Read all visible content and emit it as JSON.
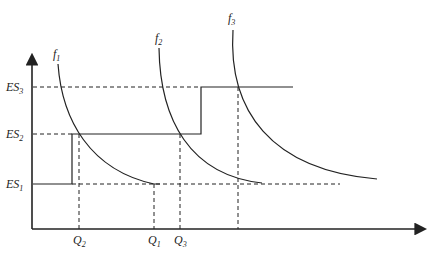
{
  "diagram": {
    "y_labels": [
      {
        "main": "ES",
        "sub": "3"
      },
      {
        "main": "ES",
        "sub": "2"
      },
      {
        "main": "ES",
        "sub": "1"
      }
    ],
    "x_labels": [
      {
        "main": "Q",
        "sub": "2"
      },
      {
        "main": "Q",
        "sub": "1"
      },
      {
        "main": "Q",
        "sub": "3"
      }
    ],
    "curve_labels": [
      {
        "main": "f",
        "sub": "1"
      },
      {
        "main": "f",
        "sub": "2"
      },
      {
        "main": "f",
        "sub": "3"
      }
    ],
    "colors": {
      "line": "#222222",
      "background": "#ffffff"
    }
  }
}
